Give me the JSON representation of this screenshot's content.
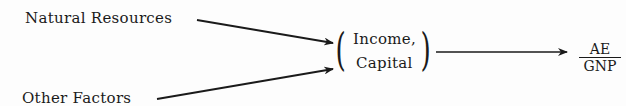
{
  "diagram": {
    "inputs": [
      {
        "label": "Natural Resources"
      },
      {
        "label": "Other Factors"
      }
    ],
    "intermediate": {
      "line1": "Income,",
      "line2": "Capital"
    },
    "output": {
      "numerator": "AE",
      "denominator": "GNP"
    },
    "colors": {
      "ink": "#1a1a1a",
      "background": "#fdfdfd"
    }
  }
}
